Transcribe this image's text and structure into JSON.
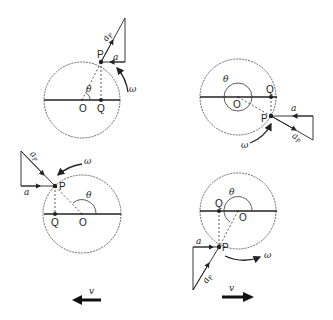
{
  "labels": {
    "P": "P",
    "Q": "Q",
    "O": "O",
    "theta": "θ",
    "omega": "ω",
    "a": "a",
    "aP": "a",
    "aP_sub": "P",
    "v": "v"
  },
  "panels": [
    {
      "id": "top-left",
      "theta_description": "P in first quadrant, acute angle θ"
    },
    {
      "id": "top-right",
      "theta_description": "P in fourth quadrant, reflex angle θ"
    },
    {
      "id": "bottom-left",
      "theta_description": "P in second quadrant, obtuse angle θ"
    },
    {
      "id": "bottom-right",
      "theta_description": "P in third quadrant, reflex angle θ"
    }
  ],
  "colors": {
    "line": "#222222",
    "background": "#ffffff"
  }
}
